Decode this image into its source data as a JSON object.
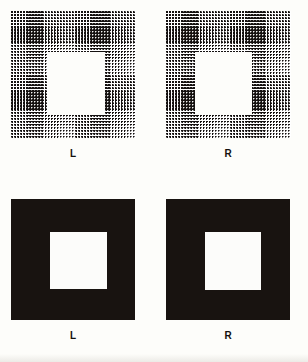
{
  "figure": {
    "kind": "stereogram-pair-figure",
    "background_color": "#fdfdfa",
    "ink_color": "#181310",
    "panel_count": 4,
    "rows": 2,
    "columns": 2
  },
  "panels": [
    {
      "id": "top-left",
      "label": "L",
      "eye": "left",
      "style": "dot-matrix",
      "description": "dot-matrix square with square hole",
      "field": {
        "x": 11,
        "y": 11,
        "w": 125,
        "h": 127
      },
      "hole": {
        "x": 48,
        "y": 52,
        "w": 57,
        "h": 63
      },
      "dot_spacing_px": 3,
      "dot_diameter_px": 2,
      "label_pos": {
        "x": 63,
        "y": 149
      }
    },
    {
      "id": "top-right",
      "label": "R",
      "eye": "right",
      "style": "dot-matrix",
      "description": "dot-matrix square with square hole shifted right",
      "field": {
        "x": 166,
        "y": 11,
        "w": 125,
        "h": 127
      },
      "hole": {
        "x": 195,
        "y": 52,
        "w": 57,
        "h": 63
      },
      "dot_spacing_px": 3,
      "dot_diameter_px": 2,
      "label_pos": {
        "x": 218,
        "y": 149
      }
    },
    {
      "id": "bottom-left",
      "label": "L",
      "eye": "left",
      "style": "solid",
      "description": "solid black square with white inner square",
      "field": {
        "x": 11,
        "y": 199,
        "w": 124,
        "h": 121
      },
      "hole": {
        "x": 50,
        "y": 232,
        "w": 57,
        "h": 57
      },
      "label_pos": {
        "x": 63,
        "y": 331
      }
    },
    {
      "id": "bottom-right",
      "label": "R",
      "eye": "right",
      "style": "solid",
      "description": "solid black square with white inner square shifted right",
      "field": {
        "x": 166,
        "y": 199,
        "w": 124,
        "h": 121
      },
      "hole": {
        "x": 205,
        "y": 232,
        "w": 56,
        "h": 58
      },
      "label_pos": {
        "x": 218,
        "y": 331
      }
    }
  ]
}
